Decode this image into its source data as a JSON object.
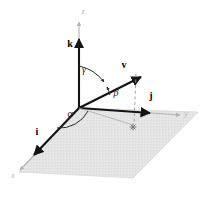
{
  "figure": {
    "background_color": "#ffffff",
    "plane": {
      "name": "xy-plane",
      "fill_color": "#e3e3e3",
      "edge_color": "#d2d2d2"
    },
    "colors": {
      "axis_gray": "#b3b3b3",
      "vector_black": "#141414",
      "dashed_gray": "#9a9a9a",
      "arc_dark": "#2a2a2a"
    }
  },
  "axes": [
    {
      "id": "z",
      "label": "z",
      "label_x": 83,
      "label_y": 14,
      "description": "vertical axis pointing up"
    },
    {
      "id": "y",
      "label": "y",
      "label_x": 186,
      "label_y": 116,
      "description": "axis going right and slightly down"
    },
    {
      "id": "x",
      "label": "x",
      "label_x": 13,
      "label_y": 178,
      "description": "axis going down-left toward viewer"
    }
  ],
  "unit_vectors": [
    {
      "id": "k",
      "label": "k",
      "label_x": 70,
      "label_y": 47,
      "axis": "z"
    },
    {
      "id": "j",
      "label": "j",
      "label_x": 151,
      "label_y": 99,
      "axis": "y"
    },
    {
      "id": "i",
      "label": "i",
      "label_x": 37,
      "label_y": 135,
      "axis": "x"
    }
  ],
  "vectors": [
    {
      "id": "v",
      "label": "v",
      "label_x": 124,
      "label_y": 68,
      "description": "general vector from origin into first octant"
    }
  ],
  "angles": [
    {
      "id": "gamma",
      "label": "γ",
      "label_x": 84,
      "label_y": 73,
      "between": [
        "z-axis",
        "v"
      ]
    },
    {
      "id": "beta",
      "label": "β",
      "label_x": 113,
      "label_y": 95,
      "between": [
        "v",
        "y-axis"
      ]
    },
    {
      "id": "alpha",
      "label": "α",
      "label_x": 70,
      "label_y": 115,
      "between": [
        "x-axis",
        "projection of v"
      ]
    }
  ],
  "markers": [
    {
      "id": "projection-point",
      "glyph": "✳",
      "x": 133,
      "y": 127,
      "description": "foot of perpendicular from v onto xy-plane"
    }
  ],
  "caption": {
    "text": "",
    "visible": false
  }
}
